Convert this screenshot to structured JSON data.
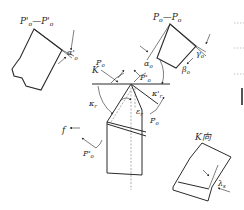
{
  "diagram": {
    "type": "turning tool geometry angles",
    "sections": {
      "orthogonal_section": {
        "title": "P",
        "title_sub": "o",
        "title_sep": "—",
        "title2": "P",
        "title2_sub": "o"
      },
      "auxiliary_section": {
        "title": "P'",
        "title_sub": "o",
        "title_sep": "—",
        "title2": "P'",
        "title2_sub": "o"
      },
      "view_k": {
        "title": "K向"
      }
    },
    "labels": {
      "K": "K",
      "P_o": {
        "main": "P",
        "sub": "o"
      },
      "P_o_prime_top": {
        "main": "P'",
        "sub": "o"
      },
      "P_o_bottom_right": {
        "main": "P",
        "sub": "o"
      },
      "P_o_prime_bottom_left": {
        "main": "P'",
        "sub": "o"
      },
      "kappa_r": {
        "main": "κ",
        "sub": "r"
      },
      "kappa_r_prime": {
        "main": "κ'",
        "sub": "r"
      },
      "epsilon_r": {
        "main": "ε",
        "sub": "r"
      },
      "alpha_o": {
        "main": "α",
        "sub": "o"
      },
      "beta_o": {
        "main": "β",
        "sub": "o"
      },
      "gamma_o": {
        "main": "γ",
        "sub": "o"
      },
      "alpha_o_prime": {
        "main": "α'",
        "sub": "o"
      },
      "lambda_s": {
        "main": "λ",
        "sub": "s"
      },
      "f": "f"
    }
  }
}
